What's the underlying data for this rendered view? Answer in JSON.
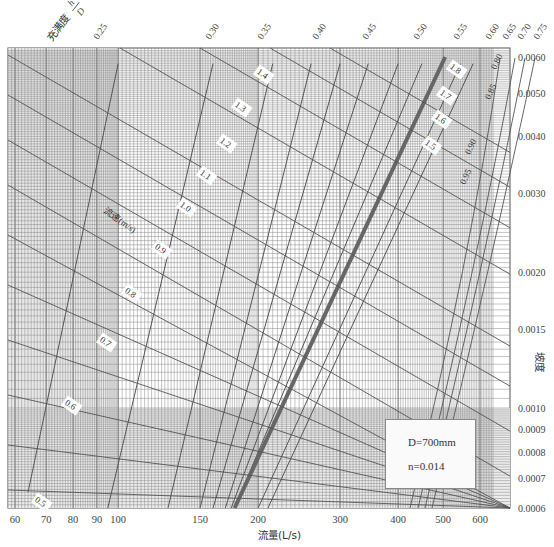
{
  "chart_data": {
    "type": "line",
    "title": "",
    "xlabel": "流量(L/s)",
    "ylabel": "坡度",
    "x_scale": "log",
    "y_scale": "log",
    "xlim": [
      57,
      650
    ],
    "ylim": [
      0.0006,
      0.0062
    ],
    "grid": true,
    "x_ticks": [
      60,
      70,
      80,
      90,
      100,
      150,
      200,
      300,
      400,
      500,
      600
    ],
    "y_ticks": [
      0.006,
      0.005,
      0.004,
      0.003,
      0.002,
      0.0015,
      0.001,
      0.0009,
      0.0008,
      0.0007,
      0.0006
    ],
    "y_tick_labels": [
      "0.0060",
      "0.0050",
      "0.0040",
      "0.0030",
      "0.0020",
      "0.0015",
      "0.0010",
      "0.0009",
      "0.0008",
      "0.0007",
      "0.0006"
    ],
    "filling_degree_title": "充满度",
    "filling_degree_symbol": "h/D",
    "filling_degree_labels": [
      "0.25",
      "0.30",
      "0.35",
      "0.40",
      "0.45",
      "0.50",
      "0.55",
      "0.60",
      "0.65",
      "0.70",
      "0.75",
      "0.80",
      "0.85",
      "0.90",
      "0.95"
    ],
    "velocity_title": "流速(m/s)",
    "velocity_labels": [
      "0.5",
      "0.6",
      "0.7",
      "0.8",
      "0.9",
      "1.0",
      "1.1",
      "1.2",
      "1.3",
      "1.4",
      "1.5",
      "1.6",
      "1.7",
      "1.8"
    ],
    "highlighted_curve": "0.65",
    "annotations": {
      "diameter": "D=700mm",
      "roughness": "n=0.014"
    },
    "series": [
      {
        "name": "h/D=0.25",
        "x": [
          64,
          100
        ],
        "y": [
          0.00065,
          0.0058
        ]
      },
      {
        "name": "h/D=0.30",
        "x": [
          95,
          160
        ],
        "y": [
          0.0006,
          0.0058
        ]
      },
      {
        "name": "h/D=0.35",
        "x": [
          128,
          215
        ],
        "y": [
          0.0006,
          0.0058
        ]
      },
      {
        "name": "h/D=0.40",
        "x": [
          150,
          260
        ],
        "y": [
          0.0006,
          0.0058
        ]
      },
      {
        "name": "h/D=0.45",
        "x": [
          160,
          300
        ],
        "y": [
          0.0006,
          0.0058
        ]
      },
      {
        "name": "h/D=0.50",
        "x": [
          170,
          345
        ],
        "y": [
          0.0006,
          0.0058
        ]
      },
      {
        "name": "h/D=0.55",
        "x": [
          175,
          400
        ],
        "y": [
          0.0006,
          0.0058
        ]
      },
      {
        "name": "h/D=0.60",
        "x": [
          178,
          450
        ],
        "y": [
          0.0006,
          0.0058
        ]
      },
      {
        "name": "h/D=0.65",
        "x": [
          178,
          505
        ],
        "y": [
          0.0006,
          0.006
        ]
      },
      {
        "name": "h/D=0.70",
        "x": [
          200,
          545
        ],
        "y": [
          0.0006,
          0.0058
        ]
      },
      {
        "name": "h/D=0.75",
        "x": [
          210,
          580
        ],
        "y": [
          0.0006,
          0.0058
        ]
      }
    ]
  },
  "labels": {
    "flow_axis": "流量(L/s)",
    "slope_axis": "坡度",
    "filling": "充满度",
    "h": "h",
    "D": "D",
    "velocity": "流速(m/s)"
  }
}
